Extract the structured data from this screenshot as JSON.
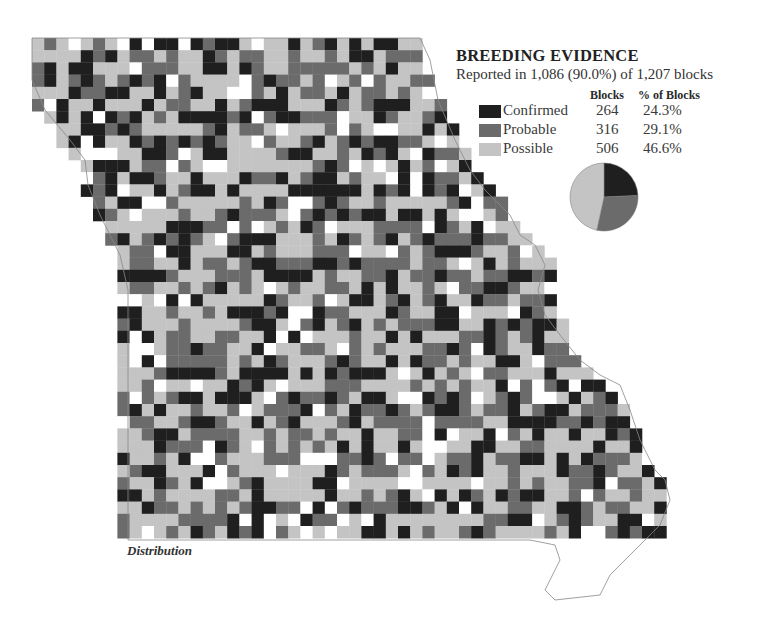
{
  "legend": {
    "title": "BREEDING EVIDENCE",
    "subtitle": "Reported in 1,086 (90.0%) of 1,207 blocks",
    "col_blocks": "Blocks",
    "col_pct": "% of Blocks",
    "categories": [
      {
        "name": "Confirmed",
        "blocks": "264",
        "pct": "24.3%",
        "color": "#1f1f1f"
      },
      {
        "name": "Probable",
        "blocks": "316",
        "pct": "29.1%",
        "color": "#6b6b6b"
      },
      {
        "name": "Possible",
        "blocks": "506",
        "pct": "46.6%",
        "color": "#c4c4c4"
      }
    ]
  },
  "map_label": "Distribution",
  "chart_data": {
    "type": "pie",
    "title": "BREEDING EVIDENCE",
    "subtitle": "Reported in 1,086 (90.0%) of 1,207 blocks",
    "categories": [
      "Confirmed",
      "Probable",
      "Possible"
    ],
    "values": [
      264,
      316,
      506
    ],
    "percentages": [
      24.3,
      29.1,
      46.6
    ],
    "total_blocks": 1207,
    "reported_blocks": 1086,
    "colors": [
      "#1f1f1f",
      "#6b6b6b",
      "#c4c4c4"
    ]
  }
}
